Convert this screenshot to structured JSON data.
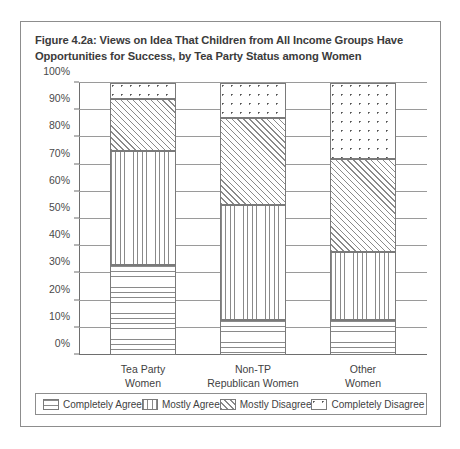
{
  "figure": {
    "title": "Figure 4.2a: Views on Idea That Children from All Income Groups Have Opportunities for Success, by Tea Party Status among Women"
  },
  "chart_data": {
    "type": "bar",
    "stacked": true,
    "stack_mode": "percent",
    "title": "Figure 4.2a: Views on Idea That Children from All Income Groups Have Opportunities for Success, by Tea Party Status among Women",
    "xlabel": "",
    "ylabel": "",
    "ylim": [
      0,
      100
    ],
    "grid": true,
    "legend_position": "bottom",
    "categories": [
      "Tea Party Women",
      "Non-TP Republican Women",
      "Other Women"
    ],
    "category_lines": [
      [
        "Tea Party",
        "Women"
      ],
      [
        "Non-TP",
        "Republican Women"
      ],
      [
        "Other",
        "Women"
      ]
    ],
    "series": [
      {
        "name": "Completely Agree",
        "pattern": "horizontal-lines",
        "values": [
          33,
          13,
          13
        ]
      },
      {
        "name": "Mostly Agree",
        "pattern": "vertical-lines",
        "values": [
          42,
          42,
          25
        ]
      },
      {
        "name": "Mostly Disagree",
        "pattern": "diagonal-lines",
        "values": [
          19,
          32,
          34
        ]
      },
      {
        "name": "Completely Disagree",
        "pattern": "dots",
        "values": [
          6,
          13,
          28
        ]
      }
    ],
    "yticks": [
      0,
      10,
      20,
      30,
      40,
      50,
      60,
      70,
      80,
      90,
      100
    ],
    "ytick_labels": [
      "0%",
      "10%",
      "20%",
      "30%",
      "40%",
      "50%",
      "60%",
      "70%",
      "80%",
      "90%",
      "100%"
    ]
  },
  "legend": {
    "items": [
      {
        "label": "Completely Agree"
      },
      {
        "label": "Mostly Agree"
      },
      {
        "label": "Mostly Disagree"
      },
      {
        "label": "Completely Disagree"
      }
    ]
  },
  "colors": {
    "frame": "#8d8d8d",
    "axis": "#6e6e6e",
    "grid": "#9a9a9a",
    "hatch": "#8a8a8a",
    "text": "#3f3f3f",
    "title_text": "#3b3b3b",
    "background": "#ffffff"
  }
}
